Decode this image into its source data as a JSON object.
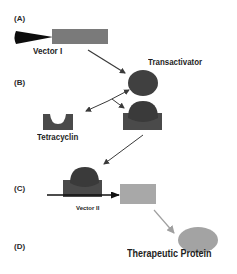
{
  "panels": {
    "a": "(A)",
    "b": "(B)",
    "c": "(C)",
    "d": "(D)"
  },
  "labels": {
    "vector_1": "Vector I",
    "transactivator": "Transactivator",
    "tetracyclin": "Tetracyclin",
    "vector_2": "Vector II",
    "therapeutic_protein": "Therapeutic Protein"
  },
  "colors": {
    "background": "#ffffff",
    "dark_shape": "#404040",
    "complex_base": "#4a4a4a",
    "gene_rect": "#7a7a7a",
    "light_rect": "#a8a8a8",
    "protein": "#a3a3a3",
    "promoter": "#0d0d0d",
    "arrow_dark": "#3a3a3a",
    "arrow_light": "#a0a0a0"
  }
}
